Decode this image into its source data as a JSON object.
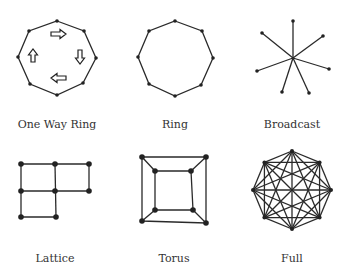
{
  "diagrams": [
    {
      "label": "One Way Ring",
      "type": "one-way-ring"
    },
    {
      "label": "Ring",
      "type": "ring"
    },
    {
      "label": "Broadcast",
      "type": "broadcast"
    },
    {
      "label": "Lattice",
      "type": "lattice"
    },
    {
      "label": "Torus",
      "type": "torus"
    },
    {
      "label": "Full",
      "type": "full"
    }
  ]
}
